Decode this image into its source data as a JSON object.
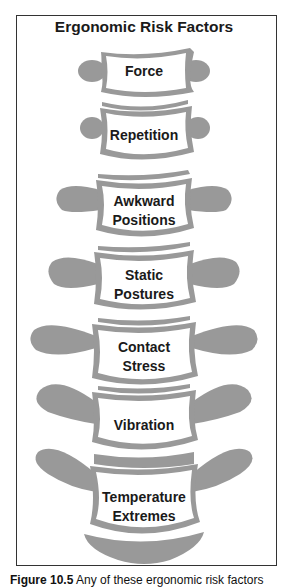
{
  "diagram": {
    "title": "Ergonomic Risk Factors",
    "colors": {
      "bone": "#999999",
      "body_fill": "#ffffff",
      "text": "#1a1a1a",
      "frame": "#333333"
    },
    "vertebrae": [
      {
        "lines": [
          "Force"
        ]
      },
      {
        "lines": [
          "Repetition"
        ]
      },
      {
        "lines": [
          "Awkward",
          "Positions"
        ]
      },
      {
        "lines": [
          "Static",
          "Postures"
        ]
      },
      {
        "lines": [
          "Contact",
          "Stress"
        ]
      },
      {
        "lines": [
          "Vibration"
        ]
      },
      {
        "lines": [
          "Temperature",
          "Extremes"
        ]
      }
    ]
  },
  "caption": {
    "figure_label": "Figure 10.5",
    "text": " Any of these ergonomic risk factors"
  }
}
